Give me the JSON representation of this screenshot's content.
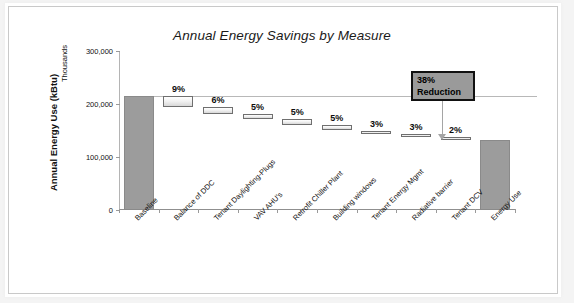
{
  "chart_data": {
    "type": "bar",
    "subtype": "waterfall",
    "title": "Annual Energy Savings by Measure",
    "xlabel": "",
    "ylabel": "Annual Energy Use (kBtu)",
    "y_units_label": "Thousands",
    "ylim": [
      0,
      300000
    ],
    "y_ticks": [
      0,
      100000,
      200000,
      300000
    ],
    "y_tick_labels": [
      "0",
      "100,000",
      "200,000",
      "300,000"
    ],
    "grid": false,
    "legend": null,
    "baseline_reference_value": 215000,
    "categories": [
      "Baseline",
      "Balance of DDC",
      "Tenant Daylighting-Plugs",
      "VAV AHU's",
      "Retrofit Chiller Plant",
      "Building windows",
      "Tenant Energy Mgmt",
      "Radiative barrier",
      "Tenant DCV",
      "Energy Use"
    ],
    "bars": [
      {
        "label": "Baseline",
        "kind": "total",
        "start": 0,
        "end": 215000,
        "value_label": ""
      },
      {
        "label": "Balance of DDC",
        "kind": "delta",
        "start": 195000,
        "end": 215000,
        "value_label": "9%"
      },
      {
        "label": "Tenant Daylighting-Plugs",
        "kind": "delta",
        "start": 182000,
        "end": 195000,
        "value_label": "6%"
      },
      {
        "label": "VAV AHU's",
        "kind": "delta",
        "start": 171000,
        "end": 182000,
        "value_label": "5%"
      },
      {
        "label": "Retrofit Chiller Plant",
        "kind": "delta",
        "start": 160000,
        "end": 171000,
        "value_label": "5%"
      },
      {
        "label": "Building windows",
        "kind": "delta",
        "start": 150000,
        "end": 160000,
        "value_label": "5%"
      },
      {
        "label": "Tenant Energy Mgmt",
        "kind": "delta",
        "start": 143000,
        "end": 150000,
        "value_label": "3%"
      },
      {
        "label": "Radiative barrier",
        "kind": "delta",
        "start": 137000,
        "end": 143000,
        "value_label": "3%"
      },
      {
        "label": "Tenant DCV",
        "kind": "delta",
        "start": 133000,
        "end": 137000,
        "value_label": "2%"
      },
      {
        "label": "Energy Use",
        "kind": "total",
        "start": 0,
        "end": 133000,
        "value_label": ""
      }
    ],
    "annotations": [
      {
        "name": "reduction-callout",
        "line1": "38%",
        "line2": "Reduction",
        "fill_color": "#9a9a9a",
        "border_color": "#111111",
        "points_to": "Energy Use"
      }
    ],
    "colors": {
      "total_bar": "#9c9c9c",
      "delta_bar": "#f2f2f2",
      "delta_bar_border": "#6f6f6f",
      "axis": "#8f8f8f",
      "text": "#111111"
    }
  }
}
